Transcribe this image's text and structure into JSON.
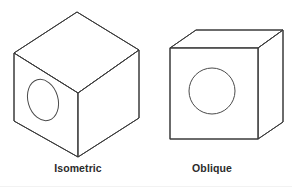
{
  "figure": {
    "background_color": "#ffffff",
    "line_color": "#3a3a3a",
    "text_color": "#2b2b2b",
    "width": 292,
    "height": 187,
    "items": [
      {
        "id": "isometric",
        "caption": "Isometric",
        "shape": "cube-with-hole",
        "projection": "isometric",
        "hole_shape": "ellipse",
        "hole_face": "left",
        "caption_x": 78,
        "geometry": {
          "top_vertex": [
            77,
            12
          ],
          "left_vertex": [
            14,
            53
          ],
          "right_vertex": [
            139,
            50
          ],
          "center_vertex": [
            78,
            93
          ],
          "bottom_left": [
            14,
            121
          ],
          "bottom_center": [
            78,
            157
          ],
          "bottom_right": [
            139,
            118
          ],
          "hole_cx": 43,
          "hole_cy": 100,
          "hole_rx": 15,
          "hole_ry": 21,
          "hole_rotation": -16
        }
      },
      {
        "id": "oblique",
        "caption": "Oblique",
        "shape": "cube-with-hole",
        "projection": "oblique",
        "hole_shape": "circle",
        "hole_face": "front",
        "caption_x": 212,
        "geometry": {
          "front_top_left": [
            170,
            48
          ],
          "front_top_right": [
            258,
            48
          ],
          "front_bottom_right": [
            258,
            139
          ],
          "front_bottom_left": [
            170,
            139
          ],
          "back_top_left": [
            196,
            30
          ],
          "back_top_right": [
            283,
            30
          ],
          "back_bottom_right": [
            283,
            122
          ],
          "hole_cx": 212,
          "hole_cy": 91,
          "hole_r": 23
        }
      }
    ]
  }
}
